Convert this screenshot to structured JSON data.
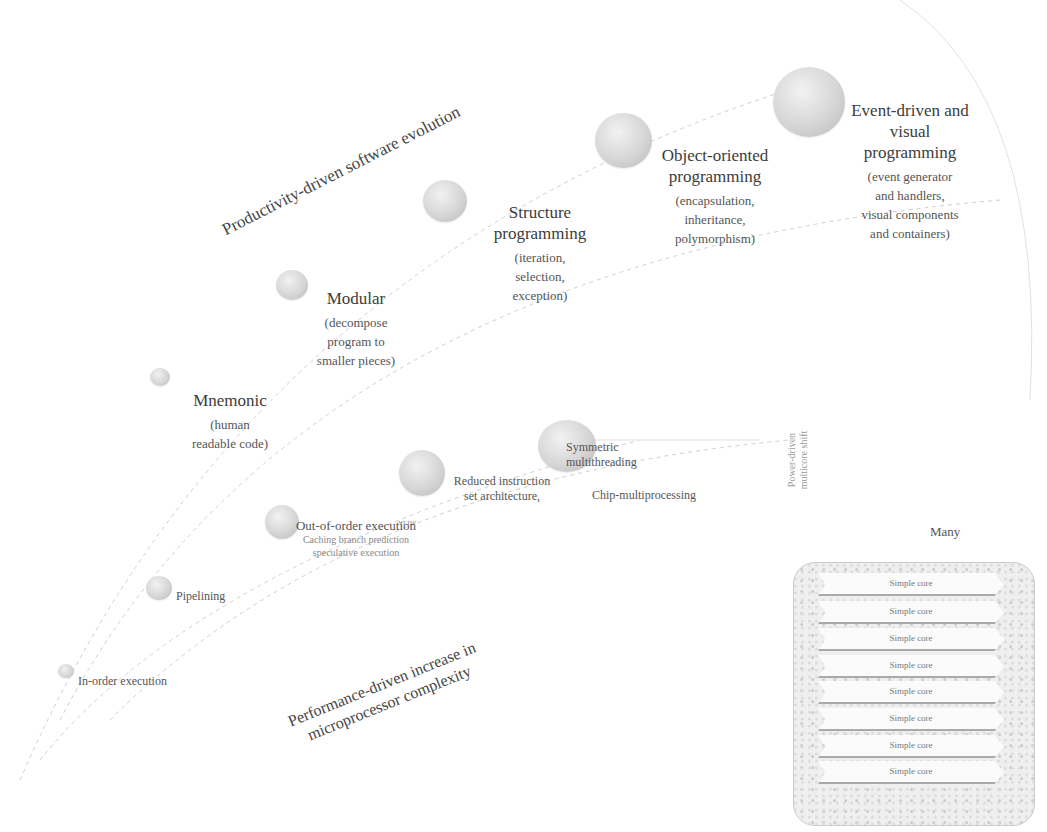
{
  "diagram": {
    "software_track": {
      "label": "Productivity-driven software evolution",
      "stages": [
        {
          "title": "Mnemonic",
          "desc": "(human readable code)"
        },
        {
          "title": "Modular",
          "desc": "(decompose program to smaller pieces)"
        },
        {
          "title": "Structure programming",
          "desc": "(iteration, selection, exception)"
        },
        {
          "title": "Object-oriented programming",
          "desc": "(encapsulation, inheritance, polymorphism)"
        },
        {
          "title": "Event-driven and visual programming",
          "desc": "(event generator and handlers, visual components and containers)"
        }
      ]
    },
    "hardware_track": {
      "label_line1": "Performance-driven increase in",
      "label_line2": "microprocessor complexity",
      "stages": [
        {
          "title": "In-order execution"
        },
        {
          "title": "Pipelining"
        },
        {
          "title": "Out-of-order execution",
          "sub": "Caching   branch prediction",
          "sub2": "speculative execution"
        },
        {
          "title": "Reduced instruction",
          "title2": "set architecture,",
          "tag": "VLIW"
        },
        {
          "title": "Symmetric",
          "title2": "multithreading"
        },
        {
          "title": "Chip-multiprocessing"
        }
      ]
    },
    "shift_label_line1": "Power-driven",
    "shift_label_line2": "multicore shift",
    "many_label": "Many",
    "cores": [
      "Simple core",
      "Simple core",
      "Simple core",
      "Simple core",
      "Simple core",
      "Simple core",
      "Simple core",
      "Simple core"
    ]
  }
}
